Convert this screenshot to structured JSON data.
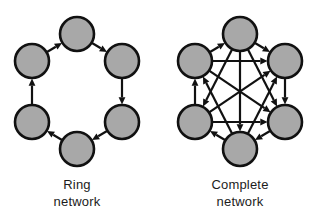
{
  "figure": {
    "background_color": "#ffffff",
    "node_fill_color": "#a8a8a8",
    "node_stroke_color": "#111111",
    "edge_color": "#111111",
    "node_radius": 17,
    "node_stroke_width": 2.6,
    "edge_width": 2.2,
    "panels": [
      {
        "id": "ring-network",
        "caption_line1": "Ring",
        "caption_line2": "network",
        "graph_type": "ring",
        "node_count": 6,
        "directed": true,
        "edge_count": 6,
        "nodes": [
          {
            "id": "r-top",
            "cx": 77,
            "cy": 34
          },
          {
            "id": "r-upper-right",
            "cx": 122,
            "cy": 61
          },
          {
            "id": "r-lower-right",
            "cx": 122,
            "cy": 122
          },
          {
            "id": "r-bottom",
            "cx": 77,
            "cy": 149
          },
          {
            "id": "r-lower-left",
            "cx": 32,
            "cy": 122
          },
          {
            "id": "r-upper-left",
            "cx": 32,
            "cy": 61
          }
        ],
        "edges": [
          {
            "from": "r-upper-left",
            "to": "r-top"
          },
          {
            "from": "r-top",
            "to": "r-upper-right"
          },
          {
            "from": "r-upper-right",
            "to": "r-lower-right"
          },
          {
            "from": "r-lower-right",
            "to": "r-bottom"
          },
          {
            "from": "r-bottom",
            "to": "r-lower-left"
          },
          {
            "from": "r-lower-left",
            "to": "r-upper-left"
          }
        ]
      },
      {
        "id": "complete-network",
        "caption_line1": "Complete",
        "caption_line2": "network",
        "graph_type": "complete",
        "node_count": 6,
        "directed": true,
        "edge_count": 15,
        "nodes": [
          {
            "id": "c-top",
            "cx": 240,
            "cy": 34
          },
          {
            "id": "c-upper-right",
            "cx": 285,
            "cy": 61
          },
          {
            "id": "c-lower-right",
            "cx": 285,
            "cy": 122
          },
          {
            "id": "c-bottom",
            "cx": 240,
            "cy": 149
          },
          {
            "id": "c-lower-left",
            "cx": 195,
            "cy": 122
          },
          {
            "id": "c-upper-left",
            "cx": 195,
            "cy": 61
          }
        ],
        "edges": [
          {
            "from": "c-upper-left",
            "to": "c-top"
          },
          {
            "from": "c-top",
            "to": "c-upper-right"
          },
          {
            "from": "c-upper-right",
            "to": "c-lower-right"
          },
          {
            "from": "c-lower-right",
            "to": "c-bottom"
          },
          {
            "from": "c-bottom",
            "to": "c-lower-left"
          },
          {
            "from": "c-lower-left",
            "to": "c-upper-left"
          },
          {
            "from": "c-upper-left",
            "to": "c-upper-right"
          },
          {
            "from": "c-lower-left",
            "to": "c-lower-right"
          },
          {
            "from": "c-top",
            "to": "c-bottom"
          },
          {
            "from": "c-upper-left",
            "to": "c-lower-right"
          },
          {
            "from": "c-lower-left",
            "to": "c-upper-right"
          },
          {
            "from": "c-top",
            "to": "c-lower-left"
          },
          {
            "from": "c-top",
            "to": "c-lower-right"
          },
          {
            "from": "c-bottom",
            "to": "c-upper-left"
          },
          {
            "from": "c-bottom",
            "to": "c-upper-right"
          }
        ]
      }
    ]
  }
}
